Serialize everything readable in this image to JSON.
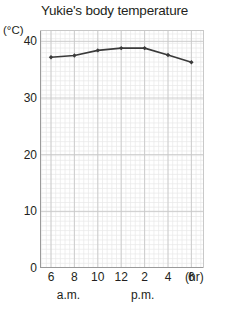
{
  "chart_data": {
    "type": "line",
    "title": "Yukie's body temperature",
    "ylabel": "(°C)",
    "xlabel": "(hr)",
    "x": [
      6,
      8,
      10,
      12,
      2,
      4,
      6
    ],
    "x_tick_labels": [
      "6",
      "8",
      "10",
      "12",
      "2",
      "4",
      "6"
    ],
    "x_period_labels": [
      "a.m.",
      "p.m."
    ],
    "values": [
      37.2,
      37.5,
      38.4,
      38.8,
      38.8,
      37.6,
      36.3
    ],
    "y_tick_labels": [
      "0",
      "10",
      "20",
      "30",
      "40"
    ],
    "y_ticks": [
      0,
      10,
      20,
      30,
      40
    ],
    "ylim": [
      0,
      42
    ],
    "grid": true,
    "minor_grid": true,
    "legend": "none",
    "line_color": "#3a3a3a",
    "marker": "diamond",
    "grid_color": "#c8c8c8",
    "minor_grid_color": "#e8e8e8"
  },
  "axis": {
    "unit_label": "(°C)",
    "hour_unit": "(hr)"
  }
}
